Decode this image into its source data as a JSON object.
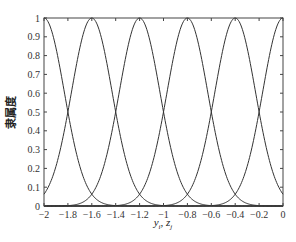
{
  "chart_data": {
    "type": "line",
    "title": "",
    "xlabel": "y_i, z_j",
    "ylabel": "隶属度",
    "xlim": [
      -2,
      0
    ],
    "ylim": [
      0,
      1
    ],
    "grid": false,
    "legend": null,
    "x_ticks": [
      "-2",
      "-1.8",
      "-1.6",
      "-1.4",
      "-1.2",
      "-1",
      "-0.8",
      "-0.6",
      "-0.4",
      "-0.2",
      "0"
    ],
    "y_ticks": [
      "0",
      "0.1",
      "0.2",
      "0.3",
      "0.4",
      "0.5",
      "0.6",
      "0.7",
      "0.8",
      "0.9",
      "1"
    ],
    "series": [
      {
        "name": "MF1",
        "shape": "gaussian",
        "center": -2.0,
        "sigma": 0.17
      },
      {
        "name": "MF2",
        "shape": "gaussian",
        "center": -1.6,
        "sigma": 0.17
      },
      {
        "name": "MF3",
        "shape": "gaussian",
        "center": -1.2,
        "sigma": 0.17
      },
      {
        "name": "MF4",
        "shape": "gaussian",
        "center": -0.8,
        "sigma": 0.17
      },
      {
        "name": "MF5",
        "shape": "gaussian",
        "center": -0.4,
        "sigma": 0.17
      },
      {
        "name": "MF6",
        "shape": "gaussian",
        "center": 0.0,
        "sigma": 0.17
      }
    ],
    "annotations": "Adjacent membership functions intersect at 0.5"
  },
  "labels": {
    "xlabel_main": "y",
    "xlabel_sub1": "i",
    "xlabel_sep": ", z",
    "xlabel_sub2": "j",
    "ylabel": "隶属度"
  }
}
